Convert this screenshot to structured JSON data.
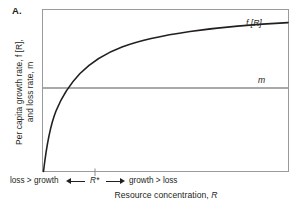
{
  "figure": {
    "panel_letter": "A.",
    "background_color": "#ffffff",
    "ink_color": "#231f20"
  },
  "axes": {
    "y_title_line1": "Per capita growth rate, f [R],",
    "y_title_line2": "and loss rate, m",
    "x_title": "Resource concentration, R",
    "frame": {
      "left": 42,
      "top": 9,
      "right": 289,
      "bottom": 172
    }
  },
  "annotations": {
    "loss_greater_than_growth": "loss > growth",
    "growth_greater_than_loss": "growth > loss",
    "r_star": "R*",
    "left_arrow_icon": "arrow-left-icon",
    "right_arrow_icon": "arrow-right-icon"
  },
  "series_labels": {
    "curve_label": "f [R]",
    "loss_line_label": "m"
  },
  "chart_data": {
    "type": "line",
    "title": "",
    "subtitle": "",
    "xlabel": "Resource concentration, R",
    "ylabel": "Per capita growth rate, f [R], and loss rate, m",
    "xlim": [
      0,
      100
    ],
    "ylim": [
      0,
      100
    ],
    "grid": false,
    "axis_ticks_labeled": false,
    "legend": "inline-labels",
    "legend_position": "right-inside",
    "annotations": [
      {
        "text": "R*",
        "x": 21,
        "y": 0,
        "type": "x-tick-marker"
      },
      {
        "text": "loss > growth",
        "x": 8,
        "y": -8,
        "type": "region-label"
      },
      {
        "text": "growth > loss",
        "x": 55,
        "y": -8,
        "type": "region-label"
      },
      {
        "text": "f [R]",
        "x": 84,
        "y": 88,
        "type": "series-label"
      },
      {
        "text": "m",
        "x": 89,
        "y": 56,
        "type": "series-label"
      }
    ],
    "series": [
      {
        "name": "f [R]",
        "type": "monod-saturation",
        "color": "#231f20",
        "linewidth": 1.5,
        "x": [
          0,
          2,
          4,
          6,
          8,
          10,
          13,
          16,
          21,
          26,
          32,
          40,
          50,
          60,
          70,
          80,
          90,
          100
        ],
        "values": [
          0,
          14.5,
          24.5,
          32,
          38,
          42.5,
          48,
          52.5,
          57.5,
          62,
          66.5,
          71.5,
          76.5,
          80,
          83,
          85.5,
          87.5,
          89.5
        ]
      },
      {
        "name": "m",
        "type": "horizontal-line",
        "color": "#8c8c8c",
        "linewidth": 1.5,
        "x": [
          0,
          100
        ],
        "values": [
          51.5,
          51.5
        ]
      }
    ],
    "intersection": {
      "label": "R*",
      "x": 21,
      "y": 51.5
    }
  }
}
